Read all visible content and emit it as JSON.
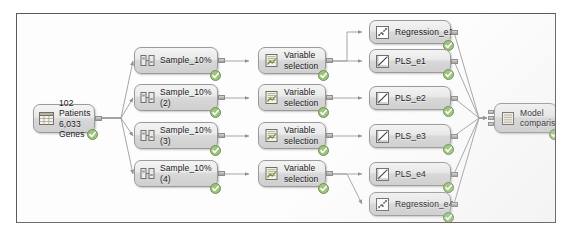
{
  "canvas": {
    "background": "#fdfdfd",
    "border_color": "#6d6d6d"
  },
  "theme": {
    "node_fill_top": "#f4f4f4",
    "node_fill_bottom": "#cfcfcf",
    "node_border": "#9a9a9a",
    "edge_color": "#9b9b9b",
    "badge_color": "#8fbf6a",
    "text_color": "#17171b"
  },
  "nodes": {
    "source": {
      "label": "102 Patients\n6,033 Genes",
      "icon": "data-table-icon",
      "status": "complete"
    },
    "samples": [
      {
        "label": "Sample_10%",
        "icon": "sample-icon",
        "status": "complete"
      },
      {
        "label": "Sample_10%\n(2)",
        "icon": "sample-icon",
        "status": "complete"
      },
      {
        "label": "Sample_10%\n(3)",
        "icon": "sample-icon",
        "status": "complete"
      },
      {
        "label": "Sample_10%\n(4)",
        "icon": "sample-icon",
        "status": "complete"
      }
    ],
    "variable_selections": [
      {
        "label": "Variable\nselection",
        "icon": "variable-selection-icon",
        "status": "complete"
      },
      {
        "label": "Variable\nselection",
        "icon": "variable-selection-icon",
        "status": "complete"
      },
      {
        "label": "Variable\nselection",
        "icon": "variable-selection-icon",
        "status": "complete"
      },
      {
        "label": "Variable\nselection",
        "icon": "variable-selection-icon",
        "status": "complete"
      }
    ],
    "models": [
      {
        "label": "Regression_e1",
        "icon": "scatter-plot-icon",
        "status": "complete"
      },
      {
        "label": "PLS_e1",
        "icon": "line-plot-icon",
        "status": "complete"
      },
      {
        "label": "PLS_e2",
        "icon": "line-plot-icon",
        "status": "complete"
      },
      {
        "label": "PLS_e3",
        "icon": "line-plot-icon",
        "status": "complete"
      },
      {
        "label": "PLS_e4",
        "icon": "line-plot-icon",
        "status": "complete"
      },
      {
        "label": "Regression_e4",
        "icon": "scatter-plot-icon",
        "status": "complete"
      }
    ],
    "comparison": {
      "label": "Model\ncomparison",
      "icon": "model-comparison-icon",
      "status": "complete"
    }
  }
}
